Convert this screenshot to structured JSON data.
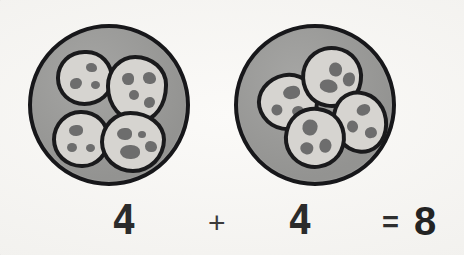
{
  "scene": {
    "title": "Cookies on two plates addition illustration",
    "background_color": "#f5f4f1",
    "width": 464,
    "height": 255
  },
  "palette": {
    "plate_fill": "#9b9b99",
    "plate_outline": "#17171a",
    "cookie_fill": "#d6d4d0",
    "cookie_outline": "#1a1a1c",
    "chip_color": "#6d6d6d",
    "text_color": "#2b2b2b"
  },
  "plates": [
    {
      "name": "left-plate",
      "cookie_count_label": "4",
      "cookies": [
        {
          "label": "cookie-1",
          "chips": [
            "chip-a",
            "chip-b",
            "chip-c"
          ]
        },
        {
          "label": "cookie-2",
          "chips": [
            "chip-a",
            "chip-b",
            "chip-c",
            "chip-d"
          ]
        },
        {
          "label": "cookie-3",
          "chips": [
            "chip-a",
            "chip-b",
            "chip-c"
          ]
        },
        {
          "label": "cookie-4",
          "chips": [
            "chip-a",
            "chip-b",
            "chip-c",
            "chip-d"
          ]
        }
      ]
    },
    {
      "name": "right-plate",
      "cookie_count_label": "4",
      "cookies": [
        {
          "label": "cookie-1",
          "chips": [
            "chip-a",
            "chip-b",
            "chip-c"
          ]
        },
        {
          "label": "cookie-2",
          "chips": [
            "chip-a",
            "chip-b",
            "chip-c"
          ]
        },
        {
          "label": "cookie-3",
          "chips": [
            "chip-a",
            "chip-b",
            "chip-c"
          ]
        },
        {
          "label": "cookie-4",
          "chips": [
            "chip-a",
            "chip-b",
            "chip-c"
          ]
        }
      ]
    }
  ],
  "equation": {
    "left_addend": "4",
    "operator_plus": "+",
    "right_addend": "4",
    "operator_equals": "=",
    "sum": "8",
    "full_text": "4 + 4 = 8"
  }
}
